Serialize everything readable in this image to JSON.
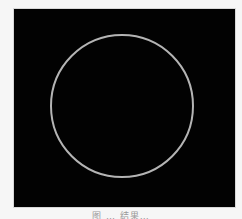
{
  "figure": {
    "background_color": "#020202",
    "shape": {
      "type": "circle",
      "stroke_color": "#b4b4b4",
      "stroke_width": 2,
      "cx": 108,
      "cy": 97,
      "r": 71
    },
    "caption": "图 … 结果…"
  }
}
